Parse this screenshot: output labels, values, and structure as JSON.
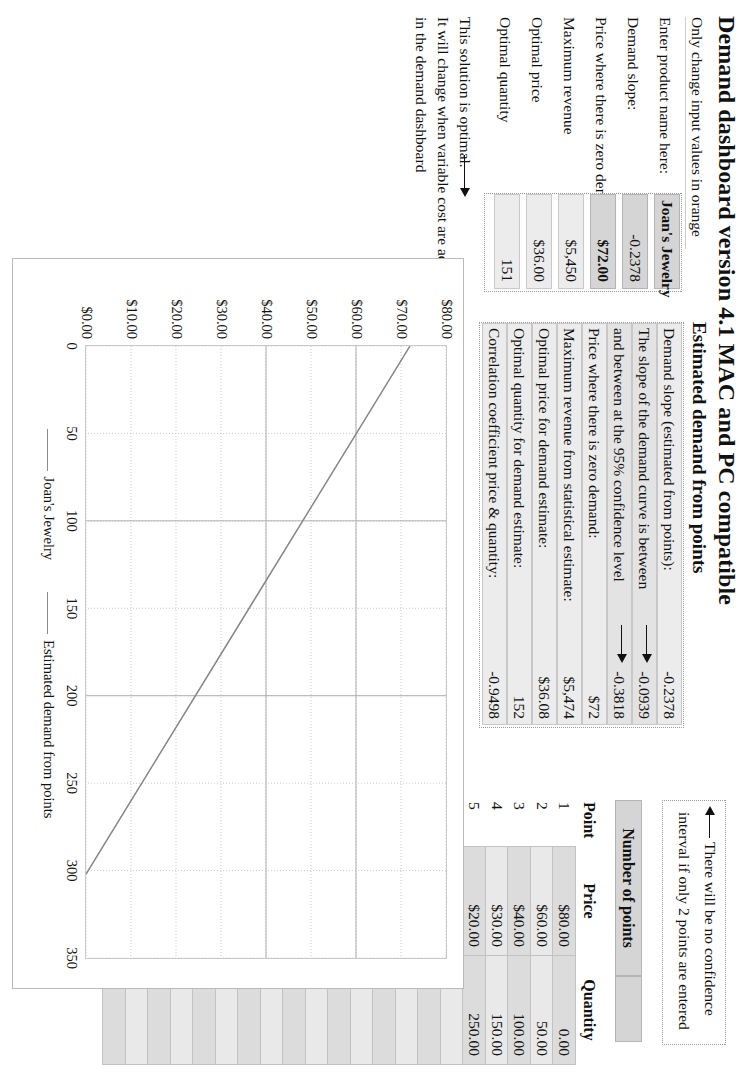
{
  "header": {
    "title": "Demand dashboard version 4.1 MAC and PC compatible",
    "subtitle": "Only change input values in orange"
  },
  "inputs": {
    "rows": [
      {
        "label": "Enter product name here:",
        "value": "Joan's Jewelry"
      },
      {
        "label": "Demand slope:",
        "value": "-0.2378"
      },
      {
        "label": "Price where there is zero demand",
        "value": "$72.00"
      },
      {
        "label": "Maximum revenue",
        "value": "$5,450"
      },
      {
        "label": "Optimal price",
        "value": "$36.00"
      },
      {
        "label": "Optimal quantity",
        "value": "151"
      }
    ],
    "note_line1": "This solution is optimal.",
    "note_line2": "It will change when variable cost are added",
    "note_line3": "in the demand dashboard"
  },
  "estimated": {
    "title": "Estimated demand from points",
    "rows": [
      {
        "label": "Demand slope (estimated from points):",
        "value": "-0.2378",
        "arrow": false
      },
      {
        "label": "The slope of the demand curve is between",
        "value": "-0.0939",
        "arrow": true
      },
      {
        "label": "and between at the 95% confidence level",
        "value": "-0.3818",
        "arrow": true
      },
      {
        "label": "Price where there is zero demand:",
        "value": "$72",
        "arrow": false
      },
      {
        "label": "Maximum revenue from statistical estimate:",
        "value": "$5,474",
        "arrow": false
      },
      {
        "label": "Optimal price for demand estimate:",
        "value": "$36.08",
        "arrow": false
      },
      {
        "label": "Optimal quantity for demand estimate:",
        "value": "152",
        "arrow": false
      },
      {
        "label": "Correlation coefficient price & quantity:",
        "value": "-0.9498",
        "arrow": false
      }
    ]
  },
  "note_box": {
    "line1": "There will be no confidence",
    "line2": "interval if only 2 points are entered"
  },
  "points_table": {
    "number_of_points_label": "Number of points",
    "number_of_points_value": "",
    "headers": {
      "point": "Point",
      "price": "Price",
      "quantity": "Quantity"
    },
    "rows": [
      {
        "point": "1",
        "price": "$80.00",
        "quantity": "0.00"
      },
      {
        "point": "2",
        "price": "$60.00",
        "quantity": "50.00"
      },
      {
        "point": "3",
        "price": "$40.00",
        "quantity": "100.00"
      },
      {
        "point": "4",
        "price": "$30.00",
        "quantity": "150.00"
      },
      {
        "point": "5",
        "price": "$20.00",
        "quantity": "250.00"
      },
      {
        "point": "6",
        "price": "",
        "quantity": ""
      },
      {
        "point": "7",
        "price": "",
        "quantity": ""
      },
      {
        "point": "8",
        "price": "",
        "quantity": ""
      },
      {
        "point": "9",
        "price": "",
        "quantity": ""
      },
      {
        "point": "10",
        "price": "",
        "quantity": ""
      },
      {
        "point": "11",
        "price": "",
        "quantity": ""
      },
      {
        "point": "12",
        "price": "",
        "quantity": ""
      },
      {
        "point": "13",
        "price": "",
        "quantity": ""
      },
      {
        "point": "14",
        "price": "",
        "quantity": ""
      },
      {
        "point": "15",
        "price": "",
        "quantity": ""
      },
      {
        "point": "16",
        "price": "",
        "quantity": ""
      },
      {
        "point": "17",
        "price": "",
        "quantity": ""
      },
      {
        "point": "18",
        "price": "",
        "quantity": ""
      },
      {
        "point": "19",
        "price": "",
        "quantity": ""
      },
      {
        "point": "20",
        "price": "",
        "quantity": ""
      },
      {
        "point": "21",
        "price": "",
        "quantity": ""
      }
    ]
  },
  "chart_data": {
    "type": "line",
    "title": "",
    "xlabel": "",
    "ylabel": "",
    "xlim": [
      0,
      350
    ],
    "ylim": [
      0,
      80
    ],
    "xticks": [
      "0",
      "50",
      "100",
      "150",
      "200",
      "250",
      "300",
      "350"
    ],
    "yticks": [
      "$0.00",
      "$10.00",
      "$20.00",
      "$30.00",
      "$40.00",
      "$50.00",
      "$60.00",
      "$70.00",
      "$80.00"
    ],
    "grid": true,
    "legend_position": "bottom",
    "series": [
      {
        "name": "Joan's Jewelry",
        "color": "#8a8a8a",
        "x": [
          0,
          302
        ],
        "y": [
          72,
          0
        ]
      },
      {
        "name": "Estimated demand from points",
        "color": "#8a8a8a",
        "x": [
          0,
          302
        ],
        "y": [
          72,
          0
        ]
      }
    ]
  }
}
